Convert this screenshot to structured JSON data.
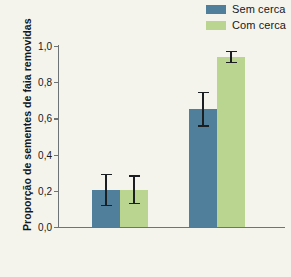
{
  "legend": {
    "position": "top-right",
    "entries": [
      {
        "label": "Sem cerca",
        "color": "#4f7f9b"
      },
      {
        "label": "Com cerca",
        "color": "#b9d590"
      }
    ]
  },
  "axes": {
    "ylabel": "Proporção de sementes de faia removidas",
    "xlabel": "",
    "yticks": [
      "1,0",
      "0,8",
      "0,6",
      "0,4",
      "0,2",
      "0,0"
    ]
  },
  "chart_data": {
    "type": "bar",
    "title": "",
    "xlabel": "",
    "ylabel": "Proporção de sementes de faia removidas",
    "ylim": [
      0,
      1
    ],
    "ytick_values": [
      1.0,
      0.8,
      0.6,
      0.4,
      0.2,
      0.0
    ],
    "ytick_labels": [
      "1,0",
      "0,8",
      "0,6",
      "0,4",
      "0,2",
      "0,0"
    ],
    "grid": false,
    "legend_position": "top-right",
    "categories": [
      "Grupo 1",
      "Grupo 2"
    ],
    "series": [
      {
        "name": "Sem cerca",
        "color": "#4f7f9b",
        "values": [
          0.205,
          0.65
        ],
        "errors": [
          0.09,
          0.095
        ]
      },
      {
        "name": "Com cerca",
        "color": "#b9d590",
        "values": [
          0.205,
          0.94
        ],
        "errors": [
          0.08,
          0.035
        ]
      }
    ]
  }
}
